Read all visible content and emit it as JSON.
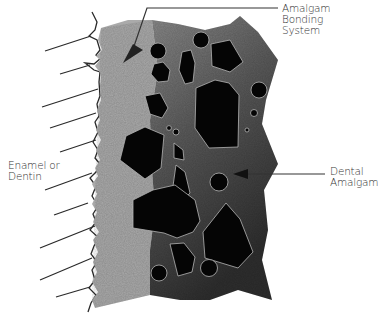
{
  "diagram": {
    "type": "cross-section schematic",
    "colors": {
      "background": "#ffffff",
      "tooth_outline": "#2a2a2a",
      "bonding_layer": "#a9a9a9",
      "amalgam_matrix_light": "#7a7a7a",
      "amalgam_matrix_dark": "#3c3c3c",
      "particles": "#050505",
      "leader_line": "#333333"
    },
    "labels": {
      "bonding": {
        "line1": "Amalgam",
        "line2": "Bonding",
        "line3": "System"
      },
      "tooth": {
        "line1": "Enamel or",
        "line2": "Dentin"
      },
      "amalgam": {
        "line1": "Dental",
        "line2": "Amalgam"
      }
    },
    "regions": [
      "Enamel or Dentin (left, hatched)",
      "Amalgam Bonding System (light gray layer)",
      "Dental Amalgam (dark gray with black particles)"
    ]
  }
}
